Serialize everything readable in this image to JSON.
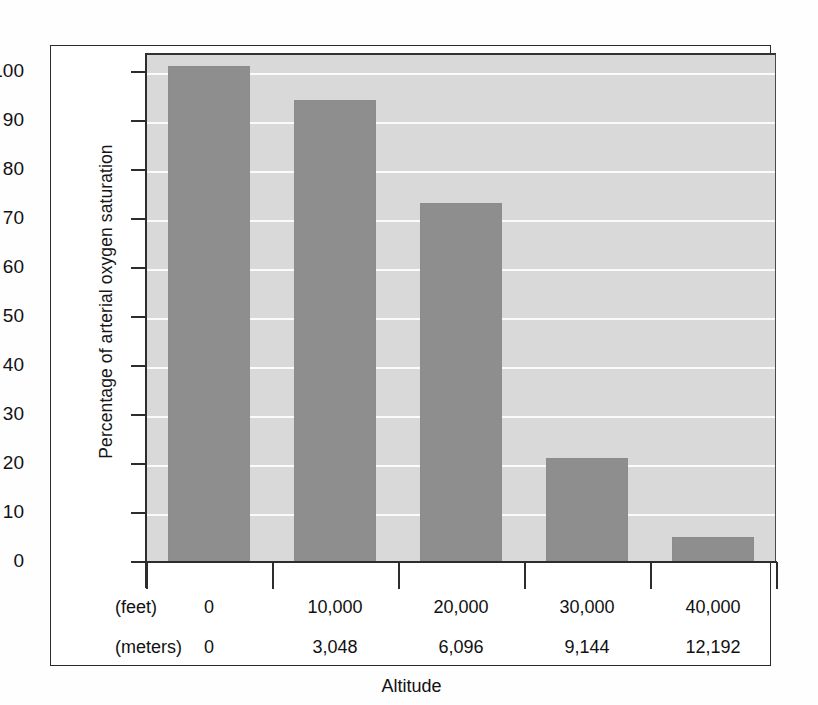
{
  "chart_data": {
    "type": "bar",
    "title": "",
    "xlabel": "Altitude",
    "ylabel": "Percentage of arterial oxygen saturation",
    "categories": [
      "0",
      "10,000",
      "20,000",
      "30,000",
      "40,000"
    ],
    "categories_secondary": [
      "0",
      "3,048",
      "6,096",
      "9,144",
      "12,192"
    ],
    "category_unit_primary": "(feet)",
    "category_unit_secondary": "(meters)",
    "values": [
      101,
      94,
      73,
      21,
      5
    ],
    "ylim": [
      0,
      105
    ],
    "yticks": [
      0,
      10,
      20,
      30,
      40,
      50,
      60,
      70,
      80,
      90,
      100
    ],
    "ytick_labels": [
      "0",
      "10",
      "20",
      "30",
      "40",
      "50",
      "60",
      "70",
      "80",
      "90",
      "100"
    ],
    "grid": true,
    "grid_color": "#fbfbfb",
    "legend": "none",
    "bar_color": "#8e8e8e",
    "plot_background": "#d9d9d9",
    "axis_color": "#2d2d2d"
  },
  "figure": {
    "border_color": "#2a2a2a",
    "background": "#ffffff"
  }
}
